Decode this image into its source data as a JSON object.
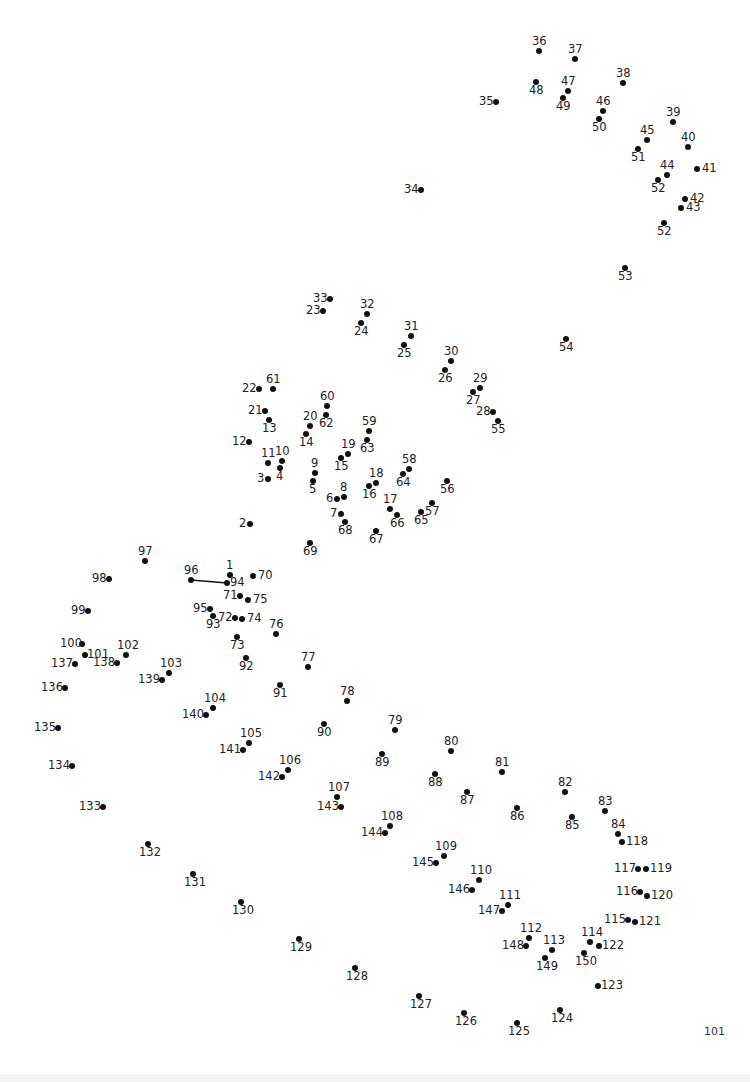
{
  "puzzle": {
    "type": "connect-the-dots",
    "page_number": "101",
    "drawn_segments": [
      [
        96,
        94
      ]
    ],
    "points": [
      {
        "n": "1",
        "x": 230,
        "y": 575,
        "lx": -4,
        "ly": -15
      },
      {
        "n": "2",
        "x": 250,
        "y": 524,
        "lx": -11,
        "ly": -6
      },
      {
        "n": "3",
        "x": 268,
        "y": 479,
        "lx": -11,
        "ly": -6
      },
      {
        "n": "4",
        "x": 280,
        "y": 468,
        "lx": -4,
        "ly": 3
      },
      {
        "n": "5",
        "x": 313,
        "y": 481,
        "lx": -4,
        "ly": 3
      },
      {
        "n": "6",
        "x": 337,
        "y": 499,
        "lx": -11,
        "ly": -6
      },
      {
        "n": "7",
        "x": 341,
        "y": 514,
        "lx": -11,
        "ly": -6
      },
      {
        "n": "8",
        "x": 344,
        "y": 497,
        "lx": -4,
        "ly": -15
      },
      {
        "n": "9",
        "x": 315,
        "y": 473,
        "lx": -4,
        "ly": -15
      },
      {
        "n": "10",
        "x": 282,
        "y": 461,
        "lx": -7,
        "ly": -15
      },
      {
        "n": "11",
        "x": 268,
        "y": 463,
        "lx": -7,
        "ly": -15
      },
      {
        "n": "12",
        "x": 249,
        "y": 442,
        "lx": -17,
        "ly": -6
      },
      {
        "n": "13",
        "x": 269,
        "y": 420,
        "lx": -7,
        "ly": 3
      },
      {
        "n": "14",
        "x": 306,
        "y": 434,
        "lx": -7,
        "ly": 3
      },
      {
        "n": "15",
        "x": 341,
        "y": 458,
        "lx": -7,
        "ly": 3
      },
      {
        "n": "16",
        "x": 369,
        "y": 486,
        "lx": -7,
        "ly": 3
      },
      {
        "n": "17",
        "x": 390,
        "y": 509,
        "lx": -7,
        "ly": -15
      },
      {
        "n": "18",
        "x": 376,
        "y": 483,
        "lx": -7,
        "ly": -15
      },
      {
        "n": "19",
        "x": 348,
        "y": 454,
        "lx": -7,
        "ly": -15
      },
      {
        "n": "20",
        "x": 310,
        "y": 426,
        "lx": -7,
        "ly": -15
      },
      {
        "n": "21",
        "x": 265,
        "y": 411,
        "lx": -17,
        "ly": -6
      },
      {
        "n": "22",
        "x": 259,
        "y": 389,
        "lx": -17,
        "ly": -6
      },
      {
        "n": "23",
        "x": 323,
        "y": 311,
        "lx": -17,
        "ly": -6
      },
      {
        "n": "24",
        "x": 361,
        "y": 323,
        "lx": -7,
        "ly": 3
      },
      {
        "n": "25",
        "x": 404,
        "y": 345,
        "lx": -7,
        "ly": 3
      },
      {
        "n": "26",
        "x": 445,
        "y": 370,
        "lx": -7,
        "ly": 3
      },
      {
        "n": "27",
        "x": 473,
        "y": 392,
        "lx": -7,
        "ly": 3
      },
      {
        "n": "28",
        "x": 493,
        "y": 412,
        "lx": -17,
        "ly": -6
      },
      {
        "n": "29",
        "x": 480,
        "y": 388,
        "lx": -7,
        "ly": -15
      },
      {
        "n": "30",
        "x": 451,
        "y": 361,
        "lx": -7,
        "ly": -15
      },
      {
        "n": "31",
        "x": 411,
        "y": 336,
        "lx": -7,
        "ly": -15
      },
      {
        "n": "32",
        "x": 367,
        "y": 314,
        "lx": -7,
        "ly": -15
      },
      {
        "n": "33",
        "x": 330,
        "y": 299,
        "lx": -17,
        "ly": -6
      },
      {
        "n": "34",
        "x": 421,
        "y": 190,
        "lx": -17,
        "ly": -6
      },
      {
        "n": "35",
        "x": 496,
        "y": 102,
        "lx": -17,
        "ly": -6
      },
      {
        "n": "36",
        "x": 539,
        "y": 51,
        "lx": -7,
        "ly": -15
      },
      {
        "n": "37",
        "x": 575,
        "y": 59,
        "lx": -7,
        "ly": -15
      },
      {
        "n": "38",
        "x": 623,
        "y": 83,
        "lx": -7,
        "ly": -15
      },
      {
        "n": "39",
        "x": 673,
        "y": 122,
        "lx": -7,
        "ly": -15
      },
      {
        "n": "40",
        "x": 688,
        "y": 147,
        "lx": -7,
        "ly": -15
      },
      {
        "n": "41",
        "x": 697,
        "y": 169,
        "lx": 5,
        "ly": -6
      },
      {
        "n": "42",
        "x": 685,
        "y": 199,
        "lx": 5,
        "ly": -6
      },
      {
        "n": "43",
        "x": 681,
        "y": 208,
        "lx": 5,
        "ly": -6
      },
      {
        "n": "44",
        "x": 667,
        "y": 175,
        "lx": -7,
        "ly": -15
      },
      {
        "n": "45",
        "x": 647,
        "y": 140,
        "lx": -7,
        "ly": -15
      },
      {
        "n": "46",
        "x": 603,
        "y": 111,
        "lx": -7,
        "ly": -15
      },
      {
        "n": "47",
        "x": 568,
        "y": 91,
        "lx": -7,
        "ly": -15
      },
      {
        "n": "48",
        "x": 536,
        "y": 82,
        "lx": -7,
        "ly": 3
      },
      {
        "n": "49",
        "x": 563,
        "y": 98,
        "lx": -7,
        "ly": 3
      },
      {
        "n": "50",
        "x": 599,
        "y": 119,
        "lx": -7,
        "ly": 3
      },
      {
        "n": "51",
        "x": 638,
        "y": 149,
        "lx": -7,
        "ly": 3
      },
      {
        "n": "52",
        "x": 658,
        "y": 180,
        "lx": -7,
        "ly": 3
      },
      {
        "n": "52",
        "x": 664,
        "y": 223,
        "lx": -7,
        "ly": 3
      },
      {
        "n": "53",
        "x": 625,
        "y": 268,
        "lx": -7,
        "ly": 3
      },
      {
        "n": "54",
        "x": 566,
        "y": 339,
        "lx": -7,
        "ly": 3
      },
      {
        "n": "55",
        "x": 498,
        "y": 421,
        "lx": -7,
        "ly": 3
      },
      {
        "n": "56",
        "x": 447,
        "y": 481,
        "lx": -7,
        "ly": 3
      },
      {
        "n": "57",
        "x": 432,
        "y": 503,
        "lx": -7,
        "ly": 3
      },
      {
        "n": "58",
        "x": 409,
        "y": 469,
        "lx": -7,
        "ly": -15
      },
      {
        "n": "59",
        "x": 369,
        "y": 431,
        "lx": -7,
        "ly": -15
      },
      {
        "n": "60",
        "x": 327,
        "y": 406,
        "lx": -7,
        "ly": -15
      },
      {
        "n": "61",
        "x": 273,
        "y": 389,
        "lx": -7,
        "ly": -15
      },
      {
        "n": "62",
        "x": 326,
        "y": 415,
        "lx": -7,
        "ly": 3
      },
      {
        "n": "63",
        "x": 367,
        "y": 440,
        "lx": -7,
        "ly": 3
      },
      {
        "n": "64",
        "x": 403,
        "y": 474,
        "lx": -7,
        "ly": 3
      },
      {
        "n": "65",
        "x": 421,
        "y": 512,
        "lx": -7,
        "ly": 3
      },
      {
        "n": "66",
        "x": 397,
        "y": 515,
        "lx": -7,
        "ly": 3
      },
      {
        "n": "67",
        "x": 376,
        "y": 531,
        "lx": -7,
        "ly": 3
      },
      {
        "n": "68",
        "x": 345,
        "y": 522,
        "lx": -7,
        "ly": 3
      },
      {
        "n": "69",
        "x": 310,
        "y": 543,
        "lx": -7,
        "ly": 3
      },
      {
        "n": "70",
        "x": 253,
        "y": 576,
        "lx": 5,
        "ly": -6
      },
      {
        "n": "71",
        "x": 240,
        "y": 596,
        "lx": -17,
        "ly": -6
      },
      {
        "n": "72",
        "x": 235,
        "y": 618,
        "lx": -17,
        "ly": -6
      },
      {
        "n": "73",
        "x": 237,
        "y": 637,
        "lx": -7,
        "ly": 3
      },
      {
        "n": "74",
        "x": 242,
        "y": 619,
        "lx": 5,
        "ly": -6
      },
      {
        "n": "75",
        "x": 248,
        "y": 600,
        "lx": 5,
        "ly": -6
      },
      {
        "n": "76",
        "x": 276,
        "y": 634,
        "lx": -7,
        "ly": -15
      },
      {
        "n": "77",
        "x": 308,
        "y": 667,
        "lx": -7,
        "ly": -15
      },
      {
        "n": "78",
        "x": 347,
        "y": 701,
        "lx": -7,
        "ly": -15
      },
      {
        "n": "79",
        "x": 395,
        "y": 730,
        "lx": -7,
        "ly": -15
      },
      {
        "n": "80",
        "x": 451,
        "y": 751,
        "lx": -7,
        "ly": -15
      },
      {
        "n": "81",
        "x": 502,
        "y": 772,
        "lx": -7,
        "ly": -15
      },
      {
        "n": "82",
        "x": 565,
        "y": 792,
        "lx": -7,
        "ly": -15
      },
      {
        "n": "83",
        "x": 605,
        "y": 811,
        "lx": -7,
        "ly": -15
      },
      {
        "n": "84",
        "x": 618,
        "y": 834,
        "lx": -7,
        "ly": -15
      },
      {
        "n": "85",
        "x": 572,
        "y": 817,
        "lx": -7,
        "ly": 3
      },
      {
        "n": "86",
        "x": 517,
        "y": 808,
        "lx": -7,
        "ly": 3
      },
      {
        "n": "87",
        "x": 467,
        "y": 792,
        "lx": -7,
        "ly": 3
      },
      {
        "n": "88",
        "x": 435,
        "y": 774,
        "lx": -7,
        "ly": 3
      },
      {
        "n": "89",
        "x": 382,
        "y": 754,
        "lx": -7,
        "ly": 3
      },
      {
        "n": "90",
        "x": 324,
        "y": 724,
        "lx": -7,
        "ly": 3
      },
      {
        "n": "91",
        "x": 280,
        "y": 685,
        "lx": -7,
        "ly": 3
      },
      {
        "n": "92",
        "x": 246,
        "y": 658,
        "lx": -7,
        "ly": 3
      },
      {
        "n": "93",
        "x": 213,
        "y": 616,
        "lx": -7,
        "ly": 3
      },
      {
        "n": "94",
        "x": 227,
        "y": 583,
        "lx": 3,
        "ly": -6
      },
      {
        "n": "95",
        "x": 210,
        "y": 609,
        "lx": -17,
        "ly": -6
      },
      {
        "n": "96",
        "x": 191,
        "y": 580,
        "lx": -7,
        "ly": -15
      },
      {
        "n": "97",
        "x": 145,
        "y": 561,
        "lx": -7,
        "ly": -15
      },
      {
        "n": "98",
        "x": 109,
        "y": 579,
        "lx": -17,
        "ly": -6
      },
      {
        "n": "99",
        "x": 88,
        "y": 611,
        "lx": -17,
        "ly": -6
      },
      {
        "n": "100",
        "x": 82,
        "y": 644,
        "lx": -22,
        "ly": -6
      },
      {
        "n": "101",
        "x": 85,
        "y": 655,
        "lx": 2,
        "ly": -6
      },
      {
        "n": "102",
        "x": 126,
        "y": 655,
        "lx": -9,
        "ly": -15
      },
      {
        "n": "103",
        "x": 169,
        "y": 673,
        "lx": -9,
        "ly": -15
      },
      {
        "n": "104",
        "x": 213,
        "y": 708,
        "lx": -9,
        "ly": -15
      },
      {
        "n": "105",
        "x": 249,
        "y": 743,
        "lx": -9,
        "ly": -15
      },
      {
        "n": "106",
        "x": 288,
        "y": 770,
        "lx": -9,
        "ly": -15
      },
      {
        "n": "107",
        "x": 337,
        "y": 797,
        "lx": -9,
        "ly": -15
      },
      {
        "n": "108",
        "x": 390,
        "y": 826,
        "lx": -9,
        "ly": -15
      },
      {
        "n": "109",
        "x": 444,
        "y": 856,
        "lx": -9,
        "ly": -15
      },
      {
        "n": "110",
        "x": 479,
        "y": 880,
        "lx": -9,
        "ly": -15
      },
      {
        "n": "111",
        "x": 508,
        "y": 905,
        "lx": -9,
        "ly": -15
      },
      {
        "n": "112",
        "x": 529,
        "y": 938,
        "lx": -9,
        "ly": -15
      },
      {
        "n": "113",
        "x": 552,
        "y": 950,
        "lx": -9,
        "ly": -15
      },
      {
        "n": "114",
        "x": 590,
        "y": 942,
        "lx": -9,
        "ly": -15
      },
      {
        "n": "115",
        "x": 628,
        "y": 920,
        "lx": -24,
        "ly": -6
      },
      {
        "n": "116",
        "x": 640,
        "y": 892,
        "lx": -24,
        "ly": -6
      },
      {
        "n": "117",
        "x": 638,
        "y": 869,
        "lx": -24,
        "ly": -6
      },
      {
        "n": "118",
        "x": 622,
        "y": 842,
        "lx": 4,
        "ly": -6
      },
      {
        "n": "119",
        "x": 646,
        "y": 869,
        "lx": 4,
        "ly": -6
      },
      {
        "n": "120",
        "x": 647,
        "y": 896,
        "lx": 4,
        "ly": -6
      },
      {
        "n": "121",
        "x": 635,
        "y": 922,
        "lx": 4,
        "ly": -6
      },
      {
        "n": "122",
        "x": 599,
        "y": 946,
        "lx": 3,
        "ly": -6
      },
      {
        "n": "123",
        "x": 598,
        "y": 986,
        "lx": 3,
        "ly": -6
      },
      {
        "n": "124",
        "x": 560,
        "y": 1010,
        "lx": -9,
        "ly": 3
      },
      {
        "n": "125",
        "x": 517,
        "y": 1023,
        "lx": -9,
        "ly": 3
      },
      {
        "n": "126",
        "x": 464,
        "y": 1013,
        "lx": -9,
        "ly": 3
      },
      {
        "n": "127",
        "x": 419,
        "y": 996,
        "lx": -9,
        "ly": 3
      },
      {
        "n": "128",
        "x": 355,
        "y": 968,
        "lx": -9,
        "ly": 3
      },
      {
        "n": "129",
        "x": 299,
        "y": 939,
        "lx": -9,
        "ly": 3
      },
      {
        "n": "130",
        "x": 241,
        "y": 902,
        "lx": -9,
        "ly": 3
      },
      {
        "n": "131",
        "x": 193,
        "y": 874,
        "lx": -9,
        "ly": 3
      },
      {
        "n": "132",
        "x": 148,
        "y": 844,
        "lx": -9,
        "ly": 3
      },
      {
        "n": "133",
        "x": 103,
        "y": 807,
        "lx": -24,
        "ly": -6
      },
      {
        "n": "134",
        "x": 72,
        "y": 766,
        "lx": -24,
        "ly": -6
      },
      {
        "n": "135",
        "x": 58,
        "y": 728,
        "lx": -24,
        "ly": -6
      },
      {
        "n": "136",
        "x": 65,
        "y": 688,
        "lx": -24,
        "ly": -6
      },
      {
        "n": "137",
        "x": 75,
        "y": 664,
        "lx": -24,
        "ly": -6
      },
      {
        "n": "138",
        "x": 117,
        "y": 663,
        "lx": -24,
        "ly": -6
      },
      {
        "n": "139",
        "x": 162,
        "y": 680,
        "lx": -24,
        "ly": -6
      },
      {
        "n": "140",
        "x": 206,
        "y": 715,
        "lx": -24,
        "ly": -6
      },
      {
        "n": "141",
        "x": 243,
        "y": 750,
        "lx": -24,
        "ly": -6
      },
      {
        "n": "142",
        "x": 282,
        "y": 777,
        "lx": -24,
        "ly": -6
      },
      {
        "n": "143",
        "x": 341,
        "y": 807,
        "lx": -24,
        "ly": -6
      },
      {
        "n": "144",
        "x": 385,
        "y": 833,
        "lx": -24,
        "ly": -6
      },
      {
        "n": "145",
        "x": 436,
        "y": 863,
        "lx": -24,
        "ly": -6
      },
      {
        "n": "146",
        "x": 472,
        "y": 890,
        "lx": -24,
        "ly": -6
      },
      {
        "n": "147",
        "x": 502,
        "y": 911,
        "lx": -24,
        "ly": -6
      },
      {
        "n": "148",
        "x": 526,
        "y": 946,
        "lx": -24,
        "ly": -6
      },
      {
        "n": "149",
        "x": 545,
        "y": 958,
        "lx": -9,
        "ly": 3
      },
      {
        "n": "150",
        "x": 584,
        "y": 953,
        "lx": -9,
        "ly": 3
      }
    ]
  }
}
